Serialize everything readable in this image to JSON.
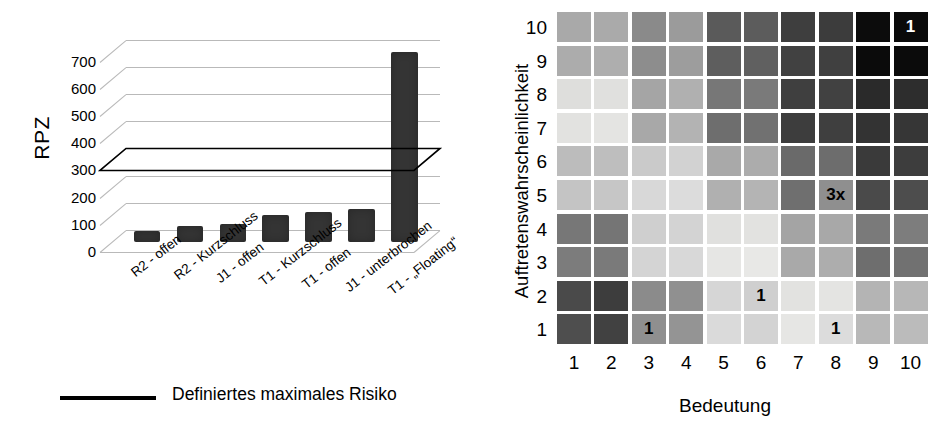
{
  "chart_data": [
    {
      "type": "bar",
      "title": "",
      "xlabel": "",
      "ylabel": "RPZ",
      "ylim": [
        0,
        780
      ],
      "yticks": [
        0,
        100,
        200,
        300,
        400,
        500,
        600,
        700
      ],
      "grid": true,
      "categories": [
        "R2 - offen",
        "R2 - Kurzschluss",
        "J1 - offen",
        "T1 - Kurzschluss",
        "T1 - offen",
        "J1 - unterbrochen",
        "T1 - „Floating“"
      ],
      "values": [
        40,
        60,
        65,
        100,
        112,
        120,
        700
      ],
      "legend": [
        {
          "label": "Definiertes maximales Risiko",
          "marker": "line",
          "color": "#000000"
        }
      ],
      "threshold_line": {
        "value": 300,
        "label": "Definiertes maximales Risiko"
      },
      "bar_color": "#343434",
      "gridline_color": "#b9b9b9",
      "legend_position": "bottom"
    },
    {
      "type": "heatmap",
      "title": "",
      "xlabel": "Bedeutung",
      "ylabel": "Auftretenswahrscheinlichkeit",
      "xticks": [
        "1",
        "2",
        "3",
        "4",
        "5",
        "6",
        "7",
        "8",
        "9",
        "10"
      ],
      "yticks": [
        "10",
        "9",
        "8",
        "7",
        "6",
        "5",
        "4",
        "3",
        "2",
        "1"
      ],
      "grid": false,
      "legend_position": "none",
      "cell_shades": [
        [
          "#a9a9a9",
          "#aaaaaa",
          "#8a8a8a",
          "#9b9b9b",
          "#5a5a5a",
          "#5c5c5c",
          "#3e3e3e",
          "#3c3c3c",
          "#0c0c0c",
          "#0a0a0a"
        ],
        [
          "#acacac",
          "#aeaeae",
          "#8d8d8d",
          "#9d9d9d",
          "#5e5e5e",
          "#606060",
          "#414141",
          "#404040",
          "#0b0b0b",
          "#0b0b0b"
        ],
        [
          "#dededc",
          "#e0e0de",
          "#a5a5a5",
          "#b0b0b0",
          "#777777",
          "#7a7a7a",
          "#3f3f3f",
          "#414141",
          "#2a2a2a",
          "#2d2d2d"
        ],
        [
          "#e2e2e0",
          "#e4e4e2",
          "#a8a8a8",
          "#b3b3b3",
          "#6e6e6e",
          "#717171",
          "#3d3d3d",
          "#3f3f3f",
          "#333333",
          "#363636"
        ],
        [
          "#bcbcbc",
          "#bebebe",
          "#cacaca",
          "#d2d2d2",
          "#a9a9a9",
          "#acacac",
          "#6a6a6a",
          "#6d6d6d",
          "#3a3a3a",
          "#3d3d3d"
        ],
        [
          "#c4c4c4",
          "#c6c6c6",
          "#d8d8d8",
          "#dcdcdc",
          "#b0b0b0",
          "#b4b4b4",
          "#6f6f6f",
          "#8f8f8f",
          "#4a4a4a",
          "#4d4d4d"
        ],
        [
          "#777777",
          "#757575",
          "#cfcfcf",
          "#d3d3d3",
          "#e0e0de",
          "#e2e2e0",
          "#a4a4a4",
          "#a8a8a8",
          "#7a7a7a",
          "#7d7d7d"
        ],
        [
          "#7c7c7c",
          "#7a7a7a",
          "#d4d4d4",
          "#d8d8d8",
          "#e6e6e4",
          "#e8e8e6",
          "#a9a9a9",
          "#adadad",
          "#6e6e6e",
          "#717171"
        ],
        [
          "#4a4a4a",
          "#3d3d3d",
          "#8b8b8b",
          "#909090",
          "#d6d6d6",
          "#cfcfcf",
          "#e2e2e0",
          "#e4e4e2",
          "#b4b4b4",
          "#b7b7b7"
        ],
        [
          "#4e4e4e",
          "#414141",
          "#8f8f8f",
          "#949494",
          "#dadada",
          "#d3d3d3",
          "#e6e6e4",
          "#dcdcdc",
          "#b8b8b8",
          "#bbbbbb"
        ]
      ],
      "annotations": [
        {
          "row": 10,
          "col": 10,
          "text": "1",
          "color": "#ffffff"
        },
        {
          "row": 5,
          "col": 8,
          "text": "3x",
          "color": "#000000"
        },
        {
          "row": 2,
          "col": 6,
          "text": "1",
          "color": "#000000"
        },
        {
          "row": 1,
          "col": 3,
          "text": "1",
          "color": "#000000"
        },
        {
          "row": 1,
          "col": 8,
          "text": "1",
          "color": "#000000"
        }
      ]
    }
  ],
  "bar_chart": {
    "y_axis_title": "RPZ",
    "y_ticks": [
      "700",
      "600",
      "500",
      "400",
      "300",
      "200",
      "100",
      "0"
    ],
    "categories": [
      "R2 - offen",
      "R2 - Kurzschluss",
      "J1 - offen",
      "T1 - Kurzschluss",
      "T1 - offen",
      "J1 - unterbrochen",
      "T1 - „Floating“"
    ],
    "legend_label": "Definiertes maximales Risiko"
  },
  "matrix_chart": {
    "y_axis_title": "Auftretenswahrscheinlichkeit",
    "x_axis_title": "Bedeutung",
    "y_ticks": [
      "10",
      "9",
      "8",
      "7",
      "6",
      "5",
      "4",
      "3",
      "2",
      "1"
    ],
    "x_ticks": [
      "1",
      "2",
      "3",
      "4",
      "5",
      "6",
      "7",
      "8",
      "9",
      "10"
    ]
  }
}
